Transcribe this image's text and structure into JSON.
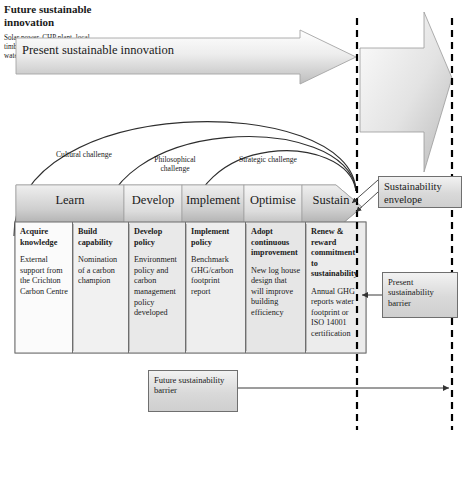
{
  "diagram": {
    "top_arrow": {
      "label": "Present sustainable innovation"
    },
    "future_innovation": {
      "heading": "Future sustainable innovation",
      "body": "Solar power, CHP plant, local timber, recycled wood, water/social footprint"
    },
    "arcs": [
      {
        "label": "Cultural challenge"
      },
      {
        "label": "Philosophical challenge"
      },
      {
        "label": "Strategic challenge"
      }
    ],
    "stages": [
      {
        "label": "Learn",
        "x": 16,
        "w": 108
      },
      {
        "label": "Develop",
        "x": 124,
        "w": 58
      },
      {
        "label": "Implement",
        "x": 182,
        "w": 62
      },
      {
        "label": "Optimise",
        "x": 244,
        "w": 58
      },
      {
        "label": "Sustain",
        "x": 302,
        "w": 58
      }
    ],
    "table": [
      {
        "heading": "Acquire knowledge",
        "body": "External support from the Crichton Carbon Centre",
        "w": 58
      },
      {
        "heading": "Build capability",
        "body": "Nomination of a carbon champion",
        "w": 56
      },
      {
        "heading": "Develop policy",
        "body": "Environment policy and carbon management policy developed",
        "w": 57
      },
      {
        "heading": "Implement policy",
        "body": "Benchmark GHG/carbon footprint report",
        "w": 60
      },
      {
        "heading": "Adopt continuous improvement",
        "body": "New log house design that will improve building efficiency",
        "w": 60
      },
      {
        "heading": "Renew & reward commitment to sustainability",
        "body": "Annual GHG reports water footprint or ISO 14001 certification",
        "w": 60
      }
    ],
    "callouts": {
      "envelope": "Sustainability envelope",
      "present_barrier": "Present sustainability barrier",
      "future_barrier": "Future sustainability barrier"
    },
    "colors": {
      "line": "#4d4d4d",
      "dashed_barrier": "#000000",
      "box_fill": "#d9d9d9",
      "stage_fill_light": "#f0f0f0",
      "stage_fill_dark": "#a9a9a9",
      "text": "#1a1a1a"
    }
  }
}
